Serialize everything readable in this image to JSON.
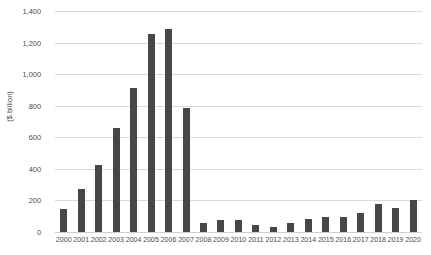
{
  "chart_data": {
    "type": "bar",
    "title": "",
    "subtitle": "",
    "xlabel": "",
    "ylabel": "($ billion)",
    "categories": [
      "2000",
      "2001",
      "2002",
      "2003",
      "2004",
      "2005",
      "2006",
      "2007",
      "2008",
      "2009",
      "2010",
      "2011",
      "2012",
      "2013",
      "2014",
      "2015",
      "2016",
      "2017",
      "2018",
      "2019",
      "2020"
    ],
    "values": [
      145,
      270,
      425,
      660,
      915,
      1255,
      1285,
      785,
      60,
      75,
      75,
      45,
      30,
      60,
      80,
      95,
      95,
      120,
      180,
      150,
      205
    ],
    "ylim": [
      0,
      1400
    ],
    "ytick_labels": [
      "1,400",
      "1,200",
      "1,000",
      "800",
      "600",
      "400",
      "200",
      "0"
    ],
    "ytick_values": [
      1400,
      1200,
      1000,
      800,
      600,
      400,
      200,
      0
    ],
    "grid": true,
    "legend": false,
    "legend_position": "none",
    "series": [
      {
        "name": "",
        "values": [
          145,
          270,
          425,
          660,
          915,
          1255,
          1285,
          785,
          60,
          75,
          75,
          45,
          30,
          60,
          80,
          95,
          95,
          120,
          180,
          150,
          205
        ]
      }
    ],
    "colors": {
      "bar": "#474747",
      "gridline": "#d9d9d9",
      "axis_text": "#4c4c4c",
      "background": "#ffffff"
    }
  }
}
